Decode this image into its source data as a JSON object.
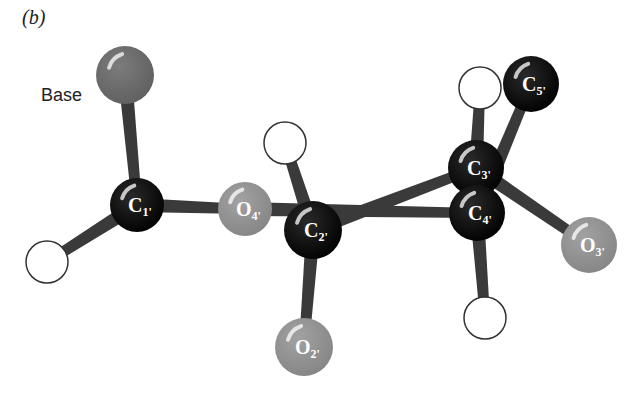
{
  "figure": {
    "panel_label": "(b)",
    "title_annotation": "Base"
  },
  "colors": {
    "carbon": "#0a0a0a",
    "oxygen": "#8e8e8e",
    "base": "#6e6e6e",
    "hydrogen_fill": "#ffffff",
    "hydrogen_stroke": "#333333",
    "bond": "#3a3a3a"
  },
  "atoms": [
    {
      "id": "base",
      "element": "Base",
      "label": "",
      "sub": "",
      "x": 125,
      "y": 75,
      "r": 29
    },
    {
      "id": "C1",
      "element": "C",
      "label": "C",
      "sub": "1'",
      "x": 137,
      "y": 205,
      "r": 27
    },
    {
      "id": "H1",
      "element": "H",
      "label": "",
      "sub": "",
      "x": 47,
      "y": 262,
      "r": 21
    },
    {
      "id": "O4",
      "element": "O",
      "label": "O",
      "sub": "4'",
      "x": 245,
      "y": 209,
      "r": 27
    },
    {
      "id": "H2",
      "element": "H",
      "label": "",
      "sub": "",
      "x": 285,
      "y": 143,
      "r": 21
    },
    {
      "id": "C2",
      "element": "C",
      "label": "C",
      "sub": "2'",
      "x": 313,
      "y": 230,
      "r": 29
    },
    {
      "id": "O2",
      "element": "O",
      "label": "O",
      "sub": "2'",
      "x": 304,
      "y": 347,
      "r": 29
    },
    {
      "id": "H3",
      "element": "H",
      "label": "",
      "sub": "",
      "x": 480,
      "y": 88,
      "r": 21
    },
    {
      "id": "C5",
      "element": "C",
      "label": "C",
      "sub": "5'",
      "x": 531,
      "y": 84,
      "r": 28
    },
    {
      "id": "C3",
      "element": "C",
      "label": "C",
      "sub": "3'",
      "x": 476,
      "y": 168,
      "r": 28
    },
    {
      "id": "C4",
      "element": "C",
      "label": "C",
      "sub": "4'",
      "x": 477,
      "y": 213,
      "r": 28
    },
    {
      "id": "O3",
      "element": "O",
      "label": "O",
      "sub": "3'",
      "x": 589,
      "y": 245,
      "r": 28
    },
    {
      "id": "H4",
      "element": "H",
      "label": "",
      "sub": "",
      "x": 485,
      "y": 318,
      "r": 21
    }
  ],
  "bonds": [
    {
      "from": "base",
      "to": "C1"
    },
    {
      "from": "C1",
      "to": "H1"
    },
    {
      "from": "C1",
      "to": "O4"
    },
    {
      "from": "O4",
      "to": "C4"
    },
    {
      "from": "C2",
      "to": "H2"
    },
    {
      "from": "C2",
      "to": "O2"
    },
    {
      "from": "C2",
      "to": "C3"
    },
    {
      "from": "C3",
      "to": "H3"
    },
    {
      "from": "C4",
      "to": "C5"
    },
    {
      "from": "C3",
      "to": "O3"
    },
    {
      "from": "C4",
      "to": "H4"
    },
    {
      "from": "C3",
      "to": "C4"
    }
  ]
}
